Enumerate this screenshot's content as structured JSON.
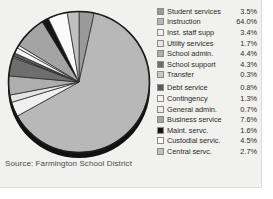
{
  "source": {
    "text": "Source: Farmington School District"
  },
  "legend": {
    "gap_after_index": 6,
    "items": [
      {
        "label": "Student services",
        "value": "3.5%",
        "color": "#9a9a9a"
      },
      {
        "label": "Instruction",
        "value": "64.0%",
        "color": "#b8b8b8"
      },
      {
        "label": "Inst. staff supp",
        "value": "3.4%",
        "color": "#f0f0f0"
      },
      {
        "label": "Utility services",
        "value": "1.7%",
        "color": "#e4e4e4"
      },
      {
        "label": "School admin.",
        "value": "4.4%",
        "color": "#aeaeae"
      },
      {
        "label": "School support",
        "value": "4.3%",
        "color": "#6e6e6e"
      },
      {
        "label": "Transfer",
        "value": "0.3%",
        "color": "#c8c8c8"
      },
      {
        "label": "Debt service",
        "value": "0.8%",
        "color": "#5a5a5a"
      },
      {
        "label": "Contingency",
        "value": "1.3%",
        "color": "#f4f4f4"
      },
      {
        "label": "General admin.",
        "value": "0.7%",
        "color": "#ededed"
      },
      {
        "label": "Business service",
        "value": "7.6%",
        "color": "#a4a4a4"
      },
      {
        "label": "Maint. servc.",
        "value": "1.6%",
        "color": "#151515"
      },
      {
        "label": "Custodial servic.",
        "value": "4.5%",
        "color": "#fafafa"
      },
      {
        "label": "Central servc.",
        "value": "2.7%",
        "color": "#c0c0c0"
      }
    ]
  },
  "chart_data": {
    "type": "pie",
    "title": "",
    "subtitle": "",
    "xlabel": "",
    "ylabel": "",
    "legend_position": "right",
    "grid": false,
    "annotations": [
      "Source: Farmington School District"
    ],
    "units": "percent",
    "total": 100.8,
    "start_angle_deg": -90,
    "direction": "clockwise",
    "categories": [
      "Student services",
      "Instruction",
      "Inst. staff supp",
      "Utility services",
      "School admin.",
      "School support",
      "Transfer",
      "Debt service",
      "Contingency",
      "General admin.",
      "Business service",
      "Maint. servc.",
      "Custodial servic.",
      "Central servc."
    ],
    "values": [
      3.5,
      64.0,
      3.4,
      1.7,
      4.4,
      4.3,
      0.3,
      0.8,
      1.3,
      0.7,
      7.6,
      1.6,
      4.5,
      2.7
    ],
    "colors": [
      "#9a9a9a",
      "#b8b8b8",
      "#f0f0f0",
      "#e4e4e4",
      "#aeaeae",
      "#6e6e6e",
      "#c8c8c8",
      "#5a5a5a",
      "#f4f4f4",
      "#ededed",
      "#a4a4a4",
      "#151515",
      "#fafafa",
      "#c0c0c0"
    ]
  }
}
